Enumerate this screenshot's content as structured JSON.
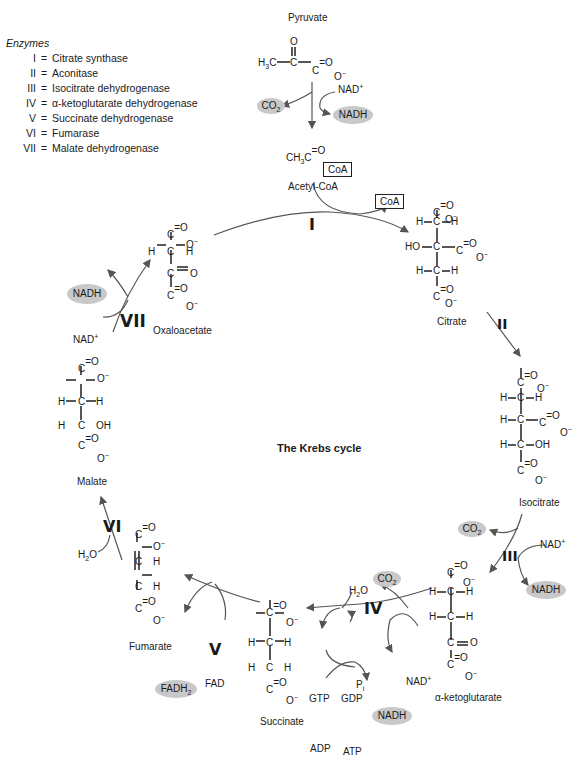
{
  "legend": {
    "title": "Enzymes",
    "items": [
      {
        "num": "I",
        "name": "Citrate synthase"
      },
      {
        "num": "II",
        "name": "Aconitase"
      },
      {
        "num": "III",
        "name": "Isocitrate dehydrogenase"
      },
      {
        "num": "IV",
        "name": "α-ketoglutarate dehydrogenase"
      },
      {
        "num": "V",
        "name": "Succinate dehydrogenase"
      },
      {
        "num": "VI",
        "name": "Fumarase"
      },
      {
        "num": "VII",
        "name": "Malate dehydrogenase"
      }
    ]
  },
  "center_title": "The Krebs cycle",
  "molecules": {
    "pyruvate": "Pyruvate",
    "acetyl_coa": "Acetyl-CoA",
    "citrate": "Citrate",
    "isocitrate": "Isocitrate",
    "alpha_ketoglutarate": "α-ketoglutarate",
    "succinate": "Succinate",
    "fumarate": "Fumarate",
    "malate": "Malate",
    "oxaloacetate": "Oxaloacetate"
  },
  "cofactors": {
    "nad": "NAD",
    "nadh": "NADH",
    "co2": "CO",
    "coa": "CoA",
    "fad": "FAD",
    "fadh2": "FADH",
    "h2o": "H",
    "gtp": "GTP",
    "gdp": "GDP",
    "adp": "ADP",
    "atp": "ATP",
    "pi": "P"
  },
  "enzyme_marks": {
    "I": "I",
    "II": "II",
    "III": "III",
    "IV": "IV",
    "V": "V",
    "VI": "VI",
    "VII": "VII"
  },
  "colors": {
    "pill": "#c8c8c8",
    "line": "#555555",
    "text": "#1a1a1a"
  }
}
